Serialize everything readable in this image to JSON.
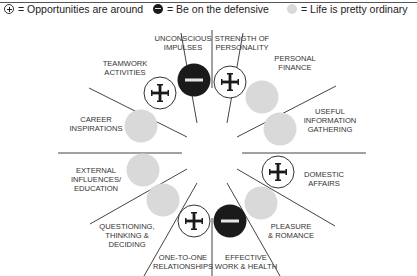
{
  "title": "YOUR MONTH AHEAD",
  "legend": [
    {
      "icon": "plus-circle-icon",
      "label": "= Opportunities are around"
    },
    {
      "icon": "minus-circle-icon",
      "label": "= Be on the defensive"
    },
    {
      "icon": "gray-circle-icon",
      "label": "= Life is pretty ordinary"
    }
  ],
  "colors": {
    "gray": "#d9d9d9",
    "dark": "#1a1a1a",
    "line": "#444444"
  },
  "segments": [
    {
      "label_line1": "STRENGTH OF",
      "label_line2": "PERSONALITY",
      "label_line3": "",
      "status": "plus"
    },
    {
      "label_line1": "PERSONAL",
      "label_line2": "FINANCE",
      "label_line3": "",
      "status": "ordinary"
    },
    {
      "label_line1": "USEFUL",
      "label_line2": "INFORMATION",
      "label_line3": "GATHERING",
      "status": "ordinary"
    },
    {
      "label_line1": "DOMESTIC",
      "label_line2": "AFFAIRS",
      "label_line3": "",
      "status": "plus"
    },
    {
      "label_line1": "PLEASURE",
      "label_line2": "& ROMANCE",
      "label_line3": "",
      "status": "ordinary"
    },
    {
      "label_line1": "EFFECTIVE",
      "label_line2": "WORK & HEALTH",
      "label_line3": "",
      "status": "minus"
    },
    {
      "label_line1": "ONE-TO-ONE",
      "label_line2": "RELATIONSHIPS",
      "label_line3": "",
      "status": "plus"
    },
    {
      "label_line1": "QUESTIONING,",
      "label_line2": "THINKING &",
      "label_line3": "DECIDING",
      "status": "ordinary"
    },
    {
      "label_line1": "EXTERNAL",
      "label_line2": "INFLUENCES/",
      "label_line3": "EDUCATION",
      "status": "ordinary"
    },
    {
      "label_line1": "CAREER",
      "label_line2": "INSPIRATIONS",
      "label_line3": "",
      "status": "ordinary"
    },
    {
      "label_line1": "TEAMWORK",
      "label_line2": "ACTIVITIES",
      "label_line3": "",
      "status": "plus"
    },
    {
      "label_line1": "UNCONSCIOUS",
      "label_line2": "IMPULSES",
      "label_line3": "",
      "status": "minus"
    }
  ]
}
